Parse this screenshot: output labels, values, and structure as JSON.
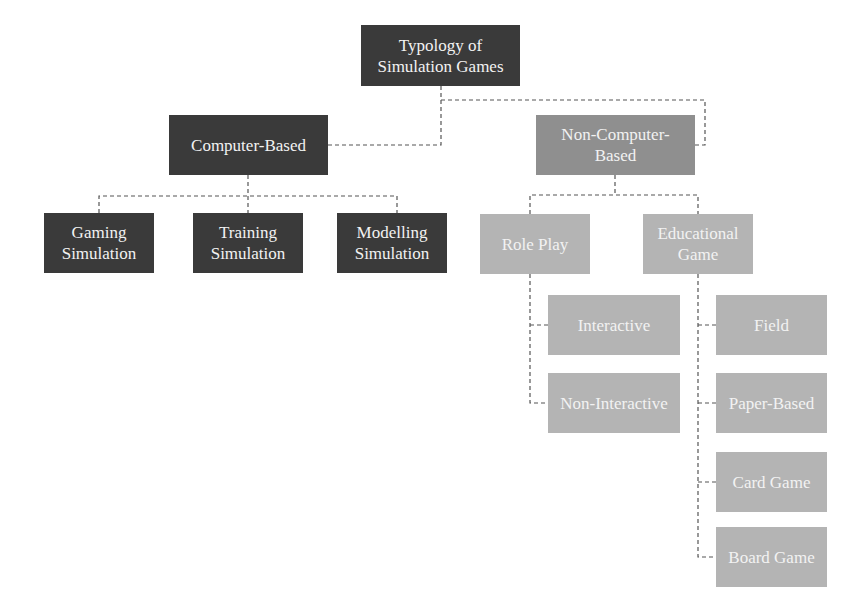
{
  "diagram": {
    "colors": {
      "level_dark": "#3a3a3a",
      "level_mid": "#8f8f8f",
      "level_light": "#b4b4b4",
      "connector": "#555555"
    },
    "root": {
      "label": "Typology of\nSimulation Games"
    },
    "computer_based": {
      "label": "Computer-Based",
      "children": [
        {
          "label": "Gaming\nSimulation"
        },
        {
          "label": "Training\nSimulation"
        },
        {
          "label": "Modelling\nSimulation"
        }
      ]
    },
    "non_computer_based": {
      "label": "Non-Computer-\nBased",
      "role_play": {
        "label": "Role Play",
        "children": [
          {
            "label": "Interactive"
          },
          {
            "label": "Non-Interactive"
          }
        ]
      },
      "educational_game": {
        "label": "Educational\nGame",
        "children": [
          {
            "label": "Field"
          },
          {
            "label": "Paper-Based"
          },
          {
            "label": "Card Game"
          },
          {
            "label": "Board Game"
          }
        ]
      }
    }
  }
}
